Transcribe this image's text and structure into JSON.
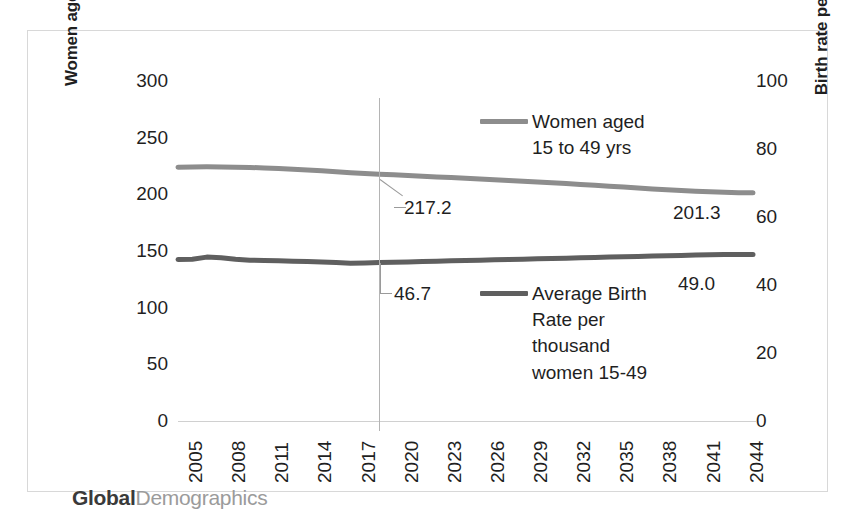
{
  "brand": {
    "primary": "Global",
    "secondary": "Demographics"
  },
  "chart_data": {
    "type": "line",
    "title": "",
    "xlabel": "",
    "ylabel": "Women aged 15 to 49 yrs. (000s)",
    "y2label": "Birth rate per thousand women 15-49\nyrs.",
    "grid": false,
    "legend_position": "inside-right",
    "ylim": [
      0,
      300
    ],
    "y2lim": [
      0,
      100
    ],
    "y_ticks": [
      300,
      250,
      200,
      150,
      100,
      50,
      0
    ],
    "y2_ticks": [
      100,
      80,
      60,
      40,
      20,
      0
    ],
    "x_tick_labels": [
      "2005",
      "2008",
      "2011",
      "2014",
      "2017",
      "2020",
      "2023",
      "2026",
      "2029",
      "2032",
      "2035",
      "2038",
      "2041",
      "2044"
    ],
    "x_start_year": 2005,
    "x_end_year": 2045,
    "divider_year": 2019,
    "series": [
      {
        "name": "Women aged\n15 to 49 yrs",
        "axis": "left",
        "color": "#8d8d8d",
        "x": [
          2005,
          2006,
          2007,
          2008,
          2009,
          2010,
          2011,
          2012,
          2013,
          2014,
          2015,
          2016,
          2017,
          2018,
          2019,
          2020,
          2021,
          2022,
          2023,
          2024,
          2025,
          2026,
          2027,
          2028,
          2029,
          2030,
          2031,
          2032,
          2033,
          2034,
          2035,
          2036,
          2037,
          2038,
          2039,
          2040,
          2041,
          2042,
          2043,
          2044,
          2045
        ],
        "values": [
          224.0,
          224.2,
          224.3,
          224.2,
          224.0,
          223.7,
          223.3,
          222.8,
          222.2,
          221.5,
          220.7,
          219.9,
          219.1,
          218.3,
          217.7,
          217.2,
          216.6,
          216.0,
          215.4,
          214.8,
          214.1,
          213.5,
          212.9,
          212.3,
          211.6,
          210.9,
          210.2,
          209.5,
          208.7,
          208.0,
          207.2,
          206.4,
          205.6,
          204.8,
          204.0,
          203.3,
          202.7,
          202.2,
          201.8,
          201.5,
          201.3
        ]
      },
      {
        "name": "Average Birth\nRate per\nthousand\nwomen 15-49",
        "axis": "right",
        "color": "#5f5f5f",
        "x": [
          2005,
          2006,
          2007,
          2008,
          2009,
          2010,
          2011,
          2012,
          2013,
          2014,
          2015,
          2016,
          2017,
          2018,
          2019,
          2020,
          2021,
          2022,
          2023,
          2024,
          2025,
          2026,
          2027,
          2028,
          2029,
          2030,
          2031,
          2032,
          2033,
          2034,
          2035,
          2036,
          2037,
          2038,
          2039,
          2040,
          2041,
          2042,
          2043,
          2044,
          2045
        ],
        "values": [
          47.5,
          47.6,
          48.2,
          48.0,
          47.6,
          47.3,
          47.2,
          47.1,
          47.0,
          46.9,
          46.8,
          46.6,
          46.4,
          46.5,
          46.6,
          46.7,
          46.8,
          46.9,
          47.0,
          47.1,
          47.2,
          47.3,
          47.4,
          47.5,
          47.6,
          47.7,
          47.8,
          47.9,
          48.0,
          48.1,
          48.2,
          48.3,
          48.4,
          48.5,
          48.6,
          48.7,
          48.8,
          48.9,
          48.95,
          49.0,
          49.0
        ]
      }
    ],
    "annotations": [
      {
        "id": "a217",
        "text": "217.2",
        "series": "Women aged 15 to 49 yrs",
        "year": 2020,
        "value": 217.2
      },
      {
        "id": "a467",
        "text": "46.7",
        "series": "Average Birth Rate per thousand women 15-49",
        "year": 2020,
        "value": 46.7
      },
      {
        "id": "a2013",
        "text": "201.3",
        "series": "Women aged 15 to 49 yrs",
        "year": 2045,
        "value": 201.3
      },
      {
        "id": "a490",
        "text": "49.0",
        "series": "Average Birth Rate per thousand women 15-49",
        "year": 2045,
        "value": 49.0
      }
    ]
  }
}
